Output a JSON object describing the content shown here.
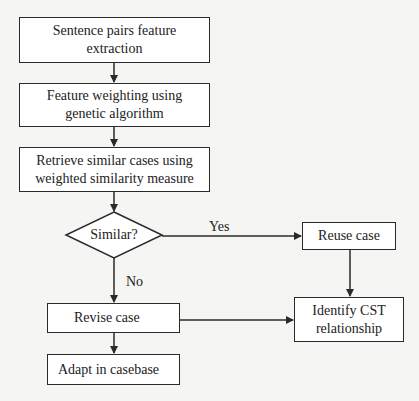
{
  "diagram": {
    "type": "flowchart",
    "nodes": {
      "feature_extraction": {
        "label_line1": "Sentence pairs feature",
        "label_line2": "extraction"
      },
      "feature_weighting": {
        "label_line1": "Feature weighting using",
        "label_line2": "genetic algorithm"
      },
      "retrieve_cases": {
        "label_line1": "Retrieve similar cases using",
        "label_line2": "weighted similarity measure"
      },
      "similar_decision": {
        "label": "Similar?"
      },
      "reuse_case": {
        "label": "Reuse case"
      },
      "revise_case": {
        "label": "Revise case"
      },
      "adapt_casebase": {
        "label": "Adapt in casebase"
      },
      "identify_cst": {
        "label_line1": "Identify CST",
        "label_line2": "relationship"
      }
    },
    "edge_labels": {
      "yes": "Yes",
      "no": "No"
    },
    "edges": [
      {
        "from": "feature_extraction",
        "to": "feature_weighting"
      },
      {
        "from": "feature_weighting",
        "to": "retrieve_cases"
      },
      {
        "from": "retrieve_cases",
        "to": "similar_decision"
      },
      {
        "from": "similar_decision",
        "to": "reuse_case",
        "label": "Yes"
      },
      {
        "from": "similar_decision",
        "to": "revise_case",
        "label": "No"
      },
      {
        "from": "reuse_case",
        "to": "identify_cst"
      },
      {
        "from": "revise_case",
        "to": "identify_cst"
      },
      {
        "from": "revise_case",
        "to": "adapt_casebase"
      }
    ],
    "colors": {
      "stroke": "#2a2a2a",
      "background": "#f5f5f3",
      "box_fill": "#ffffff"
    }
  }
}
